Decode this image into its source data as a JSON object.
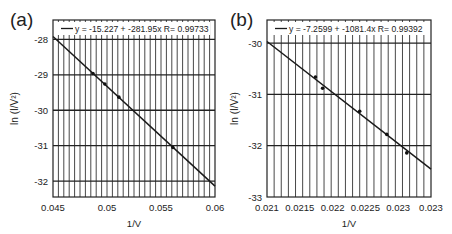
{
  "chart_data": [
    {
      "type": "scatter",
      "panel_label": "(a)",
      "title": "",
      "xlabel": "1/V",
      "ylabel": "ln (I/V²)",
      "xlim": [
        0.045,
        0.06
      ],
      "ylim": [
        -32.45,
        -27.45
      ],
      "x_ticks": [
        "0.045",
        "0.05",
        "0.055",
        "0.06"
      ],
      "y_ticks": [
        "-28",
        "-29",
        "-30",
        "-31",
        "-32"
      ],
      "grid": true,
      "legend": {
        "position": "top",
        "entries": [
          "y = -15.227 + -281.95x R= 0.99733"
        ]
      },
      "fit": {
        "intercept": -15.227,
        "slope": -281.95,
        "R": 0.99733
      },
      "points": [
        {
          "x": 0.0487,
          "y": -28.96
        },
        {
          "x": 0.0498,
          "y": -29.26
        },
        {
          "x": 0.0511,
          "y": -29.63
        },
        {
          "x": 0.0561,
          "y": -31.05
        }
      ]
    },
    {
      "type": "scatter",
      "panel_label": "(b)",
      "title": "",
      "xlabel": "1/V",
      "ylabel": "ln (I/V²)",
      "xlim": [
        0.021,
        0.0233
      ],
      "ylim": [
        -33,
        -29.55
      ],
      "x_ticks": [
        "0.021",
        "0.0215",
        "0.022",
        "0.0225",
        "0.023",
        "0.023"
      ],
      "y_ticks": [
        "-30",
        "-31",
        "-32",
        "-33"
      ],
      "grid": true,
      "legend": {
        "position": "top",
        "entries": [
          "y = -7.2599 + -1081.4x R= 0.99392"
        ]
      },
      "fit": {
        "intercept": -7.2599,
        "slope": -1081.4,
        "R": 0.99392
      },
      "points": [
        {
          "x": 0.02168,
          "y": -30.66
        },
        {
          "x": 0.02178,
          "y": -30.88
        },
        {
          "x": 0.0223,
          "y": -31.33
        },
        {
          "x": 0.02268,
          "y": -31.78
        },
        {
          "x": 0.02296,
          "y": -32.14
        }
      ]
    }
  ],
  "panels": {
    "a": {
      "label": "(a)",
      "legend": "y = -15.227 + -281.95x R= 0.99733",
      "xlabel": "1/V",
      "ylabel": "ln (I/V²)",
      "x_ticks": [
        "0.045",
        "0.05",
        "0.055",
        "0.06"
      ],
      "y_ticks": [
        "-28",
        "-29",
        "-30",
        "-31",
        "-32"
      ]
    },
    "b": {
      "label": "(b)",
      "legend": "y = -7.2599 + -1081.4x R= 0.99392",
      "xlabel": "1/V",
      "ylabel": "ln (I/V²)",
      "x_ticks": [
        "0.021",
        "0.0215",
        "0.022",
        "0.0225",
        "0.023",
        "0.023"
      ],
      "y_ticks": [
        "-30",
        "-31",
        "-32",
        "-33"
      ]
    }
  },
  "colors": {
    "line": "#1a1a1a",
    "grid": "#222222",
    "text": "#222222",
    "background": "#ffffff"
  }
}
